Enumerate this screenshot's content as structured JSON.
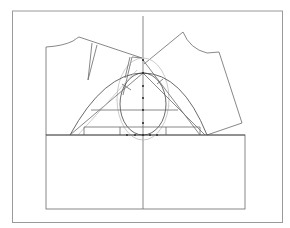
{
  "diagram": {
    "type": "sleeve-drafting-pattern",
    "colors": {
      "frame": "#9a9a9a",
      "lines": "#6a6a6a",
      "dark_lines": "#444444",
      "guide_lines": "#b5b5b5",
      "points": "#222222"
    },
    "labels": {
      "left_cap_label": "·· ···",
      "right_cap_label": "·· ···",
      "left_bottom_label": "···",
      "right_bottom_label": "···"
    },
    "center_axis_points_count": 7,
    "bottom_points_count": 5
  }
}
